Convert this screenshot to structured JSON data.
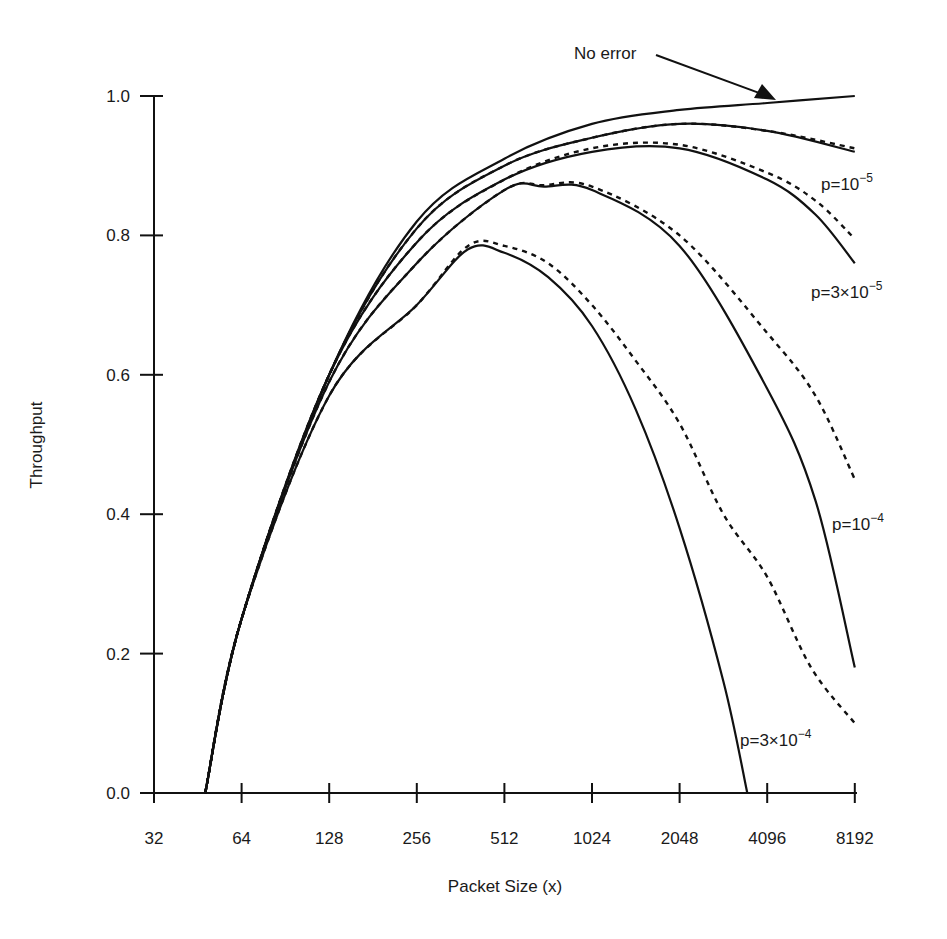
{
  "chart_data": {
    "type": "line",
    "title": "",
    "xlabel": "Packet Size (x)",
    "ylabel": "Throughput",
    "xscale": "log2",
    "x_ticks": [
      32,
      64,
      128,
      256,
      512,
      1024,
      2048,
      4096,
      8192
    ],
    "x_tick_labels": [
      "32",
      "64",
      "128",
      "256",
      "512",
      "1024",
      "2048",
      "4096",
      "8192"
    ],
    "y_ticks": [
      0.0,
      0.2,
      0.4,
      0.6,
      0.8,
      1.0
    ],
    "y_tick_labels": [
      "0.0",
      "0.2",
      "0.4",
      "0.6",
      "0.8",
      "1.0"
    ],
    "xlim": [
      32,
      8192
    ],
    "ylim": [
      0.0,
      1.0
    ],
    "grid": false,
    "legend": "none (inline annotations)",
    "series": [
      {
        "name": "No error",
        "style": "solid",
        "x": [
          48,
          64,
          128,
          256,
          512,
          1024,
          2048,
          4096,
          8192
        ],
        "y": [
          0.0,
          0.25,
          0.6,
          0.82,
          0.91,
          0.96,
          0.98,
          0.99,
          1.0
        ]
      },
      {
        "name": "p=10^-5 (solid)",
        "style": "solid",
        "x": [
          48,
          64,
          128,
          256,
          512,
          1024,
          2048,
          4096,
          8192
        ],
        "y": [
          0.0,
          0.25,
          0.6,
          0.81,
          0.9,
          0.94,
          0.96,
          0.95,
          0.92
        ]
      },
      {
        "name": "p=10^-5 (dashed)",
        "style": "dashed",
        "x": [
          48,
          64,
          128,
          256,
          512,
          1024,
          2048,
          4096,
          8192
        ],
        "y": [
          0.0,
          0.25,
          0.6,
          0.81,
          0.9,
          0.94,
          0.96,
          0.95,
          0.925
        ]
      },
      {
        "name": "p=3x10^-5 (solid)",
        "style": "solid",
        "x": [
          48,
          64,
          128,
          256,
          512,
          1024,
          2048,
          4096,
          6000,
          8192
        ],
        "y": [
          0.0,
          0.25,
          0.6,
          0.79,
          0.88,
          0.92,
          0.925,
          0.88,
          0.83,
          0.76
        ]
      },
      {
        "name": "p=3x10^-5 (dashed)",
        "style": "dashed",
        "x": [
          48,
          64,
          128,
          256,
          512,
          1024,
          2048,
          4096,
          6000,
          8192
        ],
        "y": [
          0.0,
          0.25,
          0.6,
          0.79,
          0.88,
          0.925,
          0.93,
          0.89,
          0.85,
          0.795
        ]
      },
      {
        "name": "p=10^-4 (solid)",
        "style": "solid",
        "x": [
          48,
          64,
          128,
          256,
          512,
          700,
          1024,
          2048,
          4096,
          6000,
          8192
        ],
        "y": [
          0.0,
          0.25,
          0.59,
          0.76,
          0.865,
          0.87,
          0.865,
          0.785,
          0.58,
          0.42,
          0.18
        ]
      },
      {
        "name": "p=10^-4 (dashed)",
        "style": "dashed",
        "x": [
          48,
          64,
          128,
          256,
          512,
          700,
          1024,
          2048,
          4096,
          6000,
          8192
        ],
        "y": [
          0.0,
          0.25,
          0.59,
          0.76,
          0.865,
          0.872,
          0.87,
          0.8,
          0.66,
          0.57,
          0.45
        ]
      },
      {
        "name": "p=3x10^-4 (solid)",
        "style": "solid",
        "x": [
          48,
          64,
          128,
          256,
          384,
          512,
          724,
          1024,
          1448,
          2048,
          2896,
          3500
        ],
        "y": [
          0.0,
          0.25,
          0.57,
          0.7,
          0.78,
          0.775,
          0.74,
          0.67,
          0.55,
          0.38,
          0.16,
          0.0
        ]
      },
      {
        "name": "p=3x10^-4 (dashed)",
        "style": "dashed",
        "x": [
          48,
          64,
          128,
          256,
          384,
          512,
          724,
          1024,
          1448,
          2048,
          2896,
          4096,
          5793,
          8192
        ],
        "y": [
          0.0,
          0.25,
          0.57,
          0.7,
          0.785,
          0.785,
          0.76,
          0.7,
          0.62,
          0.53,
          0.4,
          0.31,
          0.18,
          0.1
        ]
      }
    ],
    "annotations": [
      {
        "text": "No error",
        "type": "arrow-label",
        "points_to": {
          "x": 3800,
          "y": 0.99
        }
      },
      {
        "text": "p=10^-5",
        "near": {
          "x": 8192,
          "y": 0.88
        }
      },
      {
        "text": "p=3x10^-5",
        "near": {
          "x": 8192,
          "y": 0.72
        }
      },
      {
        "text": "p=10^-4",
        "near": {
          "x": 8192,
          "y": 0.4
        }
      },
      {
        "text": "p=3x10^-4",
        "near": {
          "x": 4096,
          "y": 0.09
        }
      }
    ]
  },
  "labels": {
    "xlabel": "Packet Size (x)",
    "ylabel": "Throughput",
    "no_error": "No error",
    "p1_base": "p=10",
    "p1_exp": "−5",
    "p2_base": "p=3×10",
    "p2_exp": "−5",
    "p3_base": "p=10",
    "p3_exp": "−4",
    "p4_base": "p=3×10",
    "p4_exp": "−4"
  },
  "colors": {
    "line": "#111111",
    "text": "#1a1a1a",
    "background": "#ffffff"
  }
}
